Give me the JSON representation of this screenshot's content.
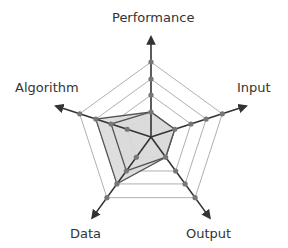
{
  "chart_data": {
    "type": "radar",
    "title": "",
    "axes": [
      "Performance",
      "Input",
      "Output",
      "Data",
      "Algorithm"
    ],
    "rings": 4,
    "grid": true,
    "series": [
      {
        "name": "outer",
        "values": [
          1,
          1,
          1,
          3,
          3
        ]
      },
      {
        "name": "inner",
        "values": [
          1,
          1,
          1,
          2,
          2
        ]
      }
    ]
  },
  "labels": {
    "performance": "Performance",
    "input": "Input",
    "output": "Output",
    "data": "Data",
    "algorithm": "Algorithm"
  },
  "colors": {
    "axis": "#333333",
    "grid": "#b0b0b0",
    "fill": "#d8d8d8",
    "marker": "#777777"
  }
}
